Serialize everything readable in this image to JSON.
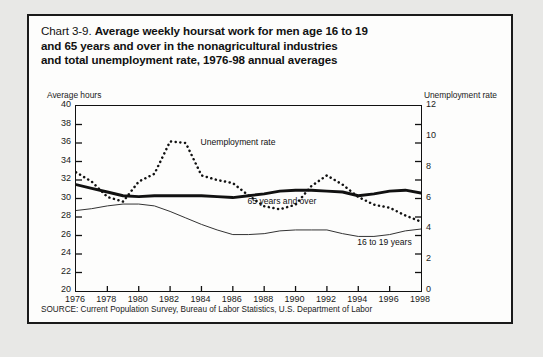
{
  "card": {
    "title_lead": "Chart 3-9. ",
    "title_bold": "Average weekly hoursat work for men age 16 to 19 and 65 years and over in the nonagricultural industries and total unemployment rate, 1976-98 annual averages",
    "title_line1": "Average weekly hoursat work for men age 16 to 19",
    "title_line2": "and 65 years and over in the nonagricultural industries",
    "title_line3": "and total unemployment rate, 1976-98 annual averages",
    "source": "SOURCE: Current Population Survey, Bureau of Labor Statistics, U.S. Department of Labor"
  },
  "chart_data": {
    "type": "line",
    "title": "Chart 3-9. Average weekly hoursat work for men age 16 to 19 and 65 years and over in the nonagricultural industries and total unemployment rate, 1976-98 annual averages",
    "xlabel": "",
    "ylabel": "Average hours",
    "y2label": "Unemployment rate",
    "ylim": [
      20,
      40
    ],
    "y2lim": [
      0,
      12
    ],
    "xlim": [
      1976,
      1998
    ],
    "grid": false,
    "legend_position": "inline-annotations",
    "yticks": [
      20,
      22,
      24,
      26,
      28,
      30,
      32,
      34,
      36,
      38,
      40
    ],
    "y2ticks": [
      0,
      2,
      4,
      6,
      8,
      10,
      12
    ],
    "xticks": [
      1976,
      1978,
      1980,
      1982,
      1984,
      1986,
      1988,
      1990,
      1992,
      1994,
      1996,
      1998
    ],
    "x": [
      1976,
      1977,
      1978,
      1979,
      1980,
      1981,
      1982,
      1983,
      1984,
      1985,
      1986,
      1987,
      1988,
      1989,
      1990,
      1991,
      1992,
      1993,
      1994,
      1995,
      1996,
      1997,
      1998
    ],
    "series": [
      {
        "name": "65 years and over",
        "axis": "left",
        "style": "thick-solid",
        "color": "#111111",
        "unit": "hours",
        "values": [
          31.5,
          31.1,
          30.7,
          30.3,
          30.2,
          30.3,
          30.3,
          30.3,
          30.3,
          30.2,
          30.1,
          30.3,
          30.5,
          30.8,
          30.9,
          30.9,
          30.8,
          30.7,
          30.3,
          30.5,
          30.8,
          30.9,
          30.6
        ]
      },
      {
        "name": "16 to 19 years",
        "axis": "left",
        "style": "thin-solid",
        "color": "#333333",
        "unit": "hours",
        "values": [
          28.7,
          28.9,
          29.2,
          29.4,
          29.4,
          29.2,
          28.6,
          27.9,
          27.2,
          26.6,
          26.1,
          26.1,
          26.2,
          26.5,
          26.6,
          26.6,
          26.6,
          26.2,
          25.9,
          25.9,
          26.1,
          26.5,
          26.7
        ]
      },
      {
        "name": "Unemployment rate",
        "axis": "right",
        "style": "dotted",
        "color": "#111111",
        "unit": "percent",
        "values": [
          7.7,
          7.1,
          6.1,
          5.8,
          7.1,
          7.6,
          9.7,
          9.6,
          7.5,
          7.2,
          7.0,
          6.2,
          5.5,
          5.3,
          5.6,
          6.8,
          7.5,
          6.9,
          6.1,
          5.6,
          5.4,
          4.9,
          4.5
        ]
      }
    ],
    "annotations": [
      {
        "text": "Unemployment rate",
        "x": 1984,
        "y_right": 9.6
      },
      {
        "text": "65 years and over",
        "x": 1987,
        "y_left": 29.6
      },
      {
        "text": "16 to 19 years",
        "x": 1994,
        "y_left": 25.2
      }
    ]
  },
  "axes": {
    "left_caption": "Average hours",
    "right_caption": "Unemployment rate"
  }
}
